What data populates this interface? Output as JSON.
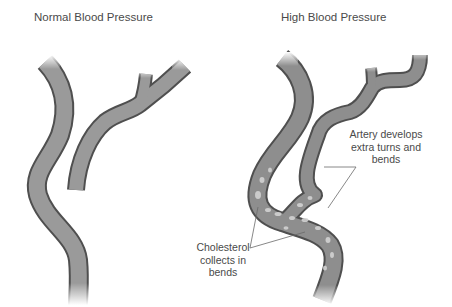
{
  "panels": {
    "normal": {
      "title": "Normal Blood Pressure"
    },
    "high": {
      "title": "High Blood Pressure",
      "annotations": {
        "turns": {
          "line1": "Artery develops",
          "line2": "extra turns and",
          "line3": "bends"
        },
        "cholesterol": {
          "line1": "Cholesterol",
          "line2": "collects in",
          "line3": "bends"
        }
      }
    }
  },
  "colors": {
    "artery_fill": "#9a9a9a",
    "artery_outline": "#4f4f4f",
    "cholesterol_plaque": "#d2d2d2",
    "text": "#4a4a4a",
    "leader_line": "#6a6a6a"
  }
}
